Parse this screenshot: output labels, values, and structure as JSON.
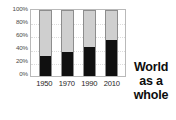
{
  "chart_data": {
    "type": "bar",
    "subtype": "stacked-100-percent",
    "title": "",
    "xlabel": "",
    "ylabel": "",
    "categories": [
      "1950",
      "1970",
      "1990",
      "2010"
    ],
    "ylim": [
      0,
      100
    ],
    "yticks": [
      "0%",
      "20%",
      "40%",
      "60%",
      "80%",
      "100%"
    ],
    "ytick_values": [
      0,
      20,
      40,
      60,
      80,
      100
    ],
    "grid": true,
    "legend": "none",
    "series": [
      {
        "name": "lower-segment",
        "color": "#101010",
        "values": [
          30,
          37,
          44,
          55
        ]
      },
      {
        "name": "upper-segment",
        "color": "#cfcfcf",
        "values": [
          70,
          63,
          56,
          45
        ]
      }
    ],
    "annotation_lines": [
      "World",
      "as a",
      "whole"
    ],
    "annotation_text": "World as a whole"
  },
  "caption": {
    "line1": "World",
    "line2": "as a",
    "line3": "whole"
  },
  "colors": {
    "dark_segment": "#101010",
    "light_segment": "#cfcfcf",
    "plot_border": "#b9b9b9",
    "gridline": "#dcdcdc",
    "axis_text": "#4a4a4a"
  }
}
